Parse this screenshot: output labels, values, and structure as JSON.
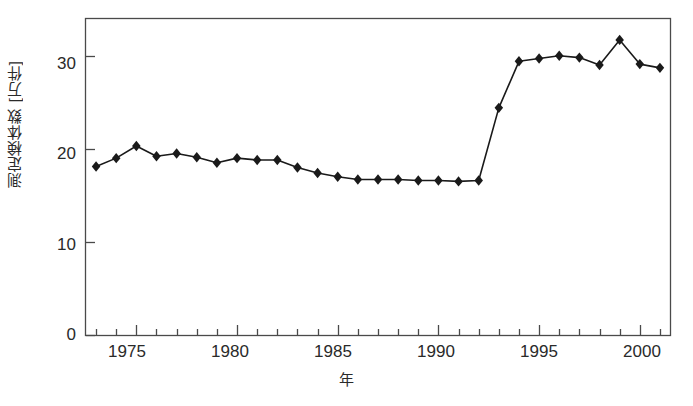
{
  "chart_data": {
    "type": "line",
    "title": "",
    "xlabel": "年",
    "ylabel": "測定検体数 [万件]",
    "xlim": [
      1972.5,
      2001.5
    ],
    "ylim": [
      0,
      34
    ],
    "grid": false,
    "legend": null,
    "marker": "filled-diamond",
    "line_color": "#1a1a1a",
    "marker_color": "#1a1a1a",
    "xticks": [
      1975,
      1980,
      1985,
      1990,
      1995,
      2000
    ],
    "xtick_labels": [
      "1975",
      "1980",
      "1985",
      "1990",
      "1995",
      "2000"
    ],
    "xminor_tick_interval": 1,
    "yticks": [
      0,
      10,
      20,
      30
    ],
    "ytick_labels": [
      "0",
      "10",
      "20",
      "30"
    ],
    "x": [
      1973,
      1974,
      1975,
      1976,
      1977,
      1978,
      1979,
      1980,
      1981,
      1982,
      1983,
      1984,
      1985,
      1986,
      1987,
      1988,
      1989,
      1990,
      1991,
      1992,
      1993,
      1994,
      1995,
      1996,
      1997,
      1998,
      1999,
      2000,
      2001
    ],
    "values": [
      18.1,
      19.0,
      20.3,
      19.2,
      19.5,
      19.1,
      18.5,
      19.0,
      18.8,
      18.8,
      18.0,
      17.4,
      17.0,
      16.7,
      16.7,
      16.7,
      16.6,
      16.6,
      16.5,
      16.6,
      24.4,
      29.4,
      29.7,
      30.0,
      29.8,
      29.0,
      31.7,
      29.1,
      28.7
    ],
    "series": [
      {
        "name": "測定検体数",
        "values": [
          18.1,
          19.0,
          20.3,
          19.2,
          19.5,
          19.1,
          18.5,
          19.0,
          18.8,
          18.8,
          18.0,
          17.4,
          17.0,
          16.7,
          16.7,
          16.7,
          16.6,
          16.6,
          16.5,
          16.6,
          24.4,
          29.4,
          29.7,
          30.0,
          29.8,
          29.0,
          31.7,
          29.1,
          28.7
        ]
      }
    ]
  },
  "axes": {
    "y_title": "測定検体数 [万件]",
    "x_title": "年",
    "ytick_labels": [
      "30",
      "20",
      "10",
      "0"
    ],
    "xtick_labels": [
      "1975",
      "1980",
      "1985",
      "1990",
      "1995",
      "2000"
    ]
  }
}
